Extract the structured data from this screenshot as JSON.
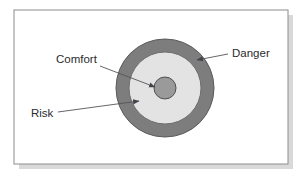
{
  "figure": {
    "type": "concentric-zone-diagram",
    "background_color": "#ffffff",
    "frame": {
      "border_color": "#8c8c8c",
      "fill_color": "#ffffff",
      "shadow_color": "#b9b9b9"
    },
    "center": {
      "x": 165,
      "y": 88
    },
    "zones": [
      {
        "id": "danger",
        "label": "Danger",
        "ring_order": "outer",
        "radius": 49,
        "fill_color": "#7d7d7d",
        "stroke_color": "#5a5a5a"
      },
      {
        "id": "risk",
        "label": "Risk",
        "ring_order": "middle",
        "radius": 36,
        "fill_color": "#e3e3e3",
        "stroke_color": "#6e6e6e"
      },
      {
        "id": "comfort",
        "label": "Comfort",
        "ring_order": "inner",
        "radius": 11,
        "fill_color": "#9a9a9a",
        "stroke_color": "#4f4f4f"
      }
    ],
    "annotations": [
      {
        "id": "comfort",
        "text": "Comfort",
        "text_x": 56,
        "text_y": 63,
        "leader_from": {
          "x": 100,
          "y": 66
        },
        "leader_to": {
          "x": 155,
          "y": 87
        }
      },
      {
        "id": "danger",
        "text": "Danger",
        "text_x": 232,
        "text_y": 57,
        "leader_from": {
          "x": 228,
          "y": 54
        },
        "leader_to": {
          "x": 197,
          "y": 60
        }
      },
      {
        "id": "risk",
        "text": "Risk",
        "text_x": 31,
        "text_y": 117,
        "leader_from": {
          "x": 58,
          "y": 112
        },
        "leader_to": {
          "x": 139,
          "y": 101
        }
      }
    ],
    "leader_color": "#55555a",
    "text_color": "#2b2b2b"
  }
}
